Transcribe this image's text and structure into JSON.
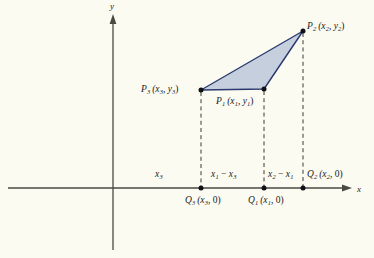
{
  "figure": {
    "type": "coordinate-geometry-diagram",
    "background_color": "#fbfbf2",
    "triangle_fill_color": "#c3ccdc",
    "triangle_stroke_color": "#2a3a6e",
    "axis_color": "#4a4a42"
  },
  "axes": {
    "x_label": "x",
    "y_label": "y",
    "origin": {
      "x": 113,
      "y": 188
    },
    "x_axis": {
      "start_x": 8,
      "end_x": 352,
      "y": 188
    },
    "y_axis": {
      "x": 113,
      "top_y": 14,
      "bottom_y": 250
    }
  },
  "vertices": [
    {
      "name": "P1",
      "label_base": "P",
      "label_sub": "1",
      "coords": "(x",
      "px": 264,
      "py": 89
    },
    {
      "name": "P2",
      "label_base": "P",
      "label_sub": "2",
      "px": 303,
      "py": 31
    },
    {
      "name": "P3",
      "label_base": "P",
      "label_sub": "3",
      "px": 201,
      "py": 90
    }
  ],
  "feet": [
    {
      "name": "Q1",
      "px": 264,
      "py": 188
    },
    {
      "name": "Q2",
      "px": 303,
      "py": 188
    },
    {
      "name": "Q3",
      "px": 201,
      "py": 188
    }
  ],
  "labels": {
    "p1": {
      "text": "P₁ (x₁, y₁)",
      "main": "P",
      "sub": "1",
      "args": "(x",
      "sub2": "1",
      "mid": ", y",
      "sub3": "1",
      "close": ")"
    },
    "p2": {
      "main": "P",
      "sub": "2",
      "args_open": "(x",
      "sub2": "2",
      "mid": ", y",
      "sub3": "2",
      "close": ")"
    },
    "p3": {
      "main": "P",
      "sub": "3",
      "args_open": "(x",
      "sub2": "3",
      "mid": ", y",
      "sub3": "3",
      "close": ")"
    },
    "q1": {
      "main": "Q",
      "sub": "1",
      "args_open": "(x",
      "sub2": "1",
      "mid": ", ",
      "zero": "0",
      "close": ")"
    },
    "q2": {
      "main": "Q",
      "sub": "2",
      "args_open": "(x",
      "sub2": "2",
      "mid": ", ",
      "zero": "0",
      "close": ")"
    },
    "q3": {
      "main": "Q",
      "sub": "3",
      "args_open": "(x",
      "sub2": "3",
      "mid": ", ",
      "zero": "0",
      "close": ")"
    },
    "seg_x3": {
      "main": "x",
      "sub": "3"
    },
    "seg_x1_minus_x3": {
      "main": "x",
      "sub": "1",
      "op": " − ",
      "main2": "x",
      "sub2": "3"
    },
    "seg_x2_minus_x1": {
      "main": "x",
      "sub": "2",
      "op": " − ",
      "main2": "x",
      "sub2": "1"
    },
    "axis_x": "x",
    "axis_y": "y"
  }
}
